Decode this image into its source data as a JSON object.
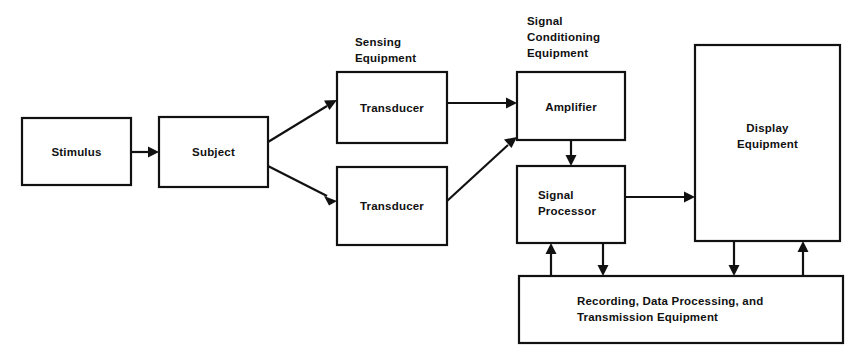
{
  "diagram": {
    "type": "block-diagram",
    "canvas": {
      "width": 868,
      "height": 362
    },
    "colors": {
      "background": "#ffffff",
      "stroke": "#111111",
      "box_fill": "#ffffff",
      "text": "#111111"
    },
    "group_labels": [
      {
        "id": "sensing-equipment",
        "lines": [
          "Sensing",
          "Equipment"
        ],
        "line1": "Sensing",
        "line2": "Equipment",
        "x": 355,
        "y": 42
      },
      {
        "id": "signal-conditioning-equipment",
        "lines": [
          "Signal",
          "Conditioning",
          "Equipment"
        ],
        "line1": "Signal",
        "line2": "Conditioning",
        "line3": "Equipment",
        "x": 527,
        "y": 25
      }
    ],
    "boxes": [
      {
        "id": "stimulus",
        "lines": [
          "Stimulus"
        ],
        "line1": "Stimulus",
        "x": 22,
        "y": 118,
        "w": 109,
        "h": 67,
        "text_align": "center"
      },
      {
        "id": "subject",
        "lines": [
          "Subject"
        ],
        "line1": "Subject",
        "x": 159,
        "y": 117,
        "w": 109,
        "h": 70,
        "text_align": "center"
      },
      {
        "id": "transducer-upper",
        "lines": [
          "Transducer"
        ],
        "line1": "Transducer",
        "x": 337,
        "y": 72,
        "w": 110,
        "h": 71,
        "text_align": "center"
      },
      {
        "id": "transducer-lower",
        "lines": [
          "Transducer"
        ],
        "line1": "Transducer",
        "x": 337,
        "y": 167,
        "w": 110,
        "h": 78,
        "text_align": "center"
      },
      {
        "id": "amplifier",
        "lines": [
          "Amplifier"
        ],
        "line1": "Amplifier",
        "x": 517,
        "y": 72,
        "w": 108,
        "h": 68,
        "text_align": "center"
      },
      {
        "id": "signal-processor",
        "lines": [
          "Signal",
          "Processor"
        ],
        "line1": "Signal",
        "line2": "Processor",
        "x": 517,
        "y": 166,
        "w": 108,
        "h": 77,
        "text_align": "left"
      },
      {
        "id": "display-equipment",
        "lines": [
          "Display",
          "Equipment"
        ],
        "line1": "Display",
        "line2": "Equipment",
        "x": 695,
        "y": 45,
        "w": 145,
        "h": 196,
        "text_align": "center"
      },
      {
        "id": "recording-data-processing",
        "lines": [
          "Recording, Data Processing, and",
          "Transmission Equipment"
        ],
        "line1": "Recording, Data Processing, and",
        "line2": "Transmission Equipment",
        "x": 519,
        "y": 276,
        "w": 324,
        "h": 67,
        "text_align": "left"
      }
    ],
    "connections": [
      {
        "id": "stimulus-to-subject",
        "from": "stimulus",
        "to": "subject",
        "kind": "straight-right"
      },
      {
        "id": "subject-to-transducer-upper",
        "from": "subject",
        "to": "transducer-upper",
        "kind": "diagonal-up-right"
      },
      {
        "id": "subject-to-transducer-lower",
        "from": "subject",
        "to": "transducer-lower",
        "kind": "diagonal-down-right"
      },
      {
        "id": "transducer-upper-to-amplifier",
        "from": "transducer-upper",
        "to": "amplifier",
        "kind": "straight-right"
      },
      {
        "id": "transducer-lower-to-amplifier",
        "from": "transducer-lower",
        "to": "amplifier",
        "kind": "diagonal-up-right"
      },
      {
        "id": "amplifier-to-signal-processor",
        "from": "amplifier",
        "to": "signal-processor",
        "kind": "straight-down"
      },
      {
        "id": "signal-processor-to-display",
        "from": "signal-processor",
        "to": "display-equipment",
        "kind": "straight-right"
      },
      {
        "id": "recording-to-signal-processor",
        "from": "recording-data-processing",
        "to": "signal-processor",
        "kind": "straight-up"
      },
      {
        "id": "signal-processor-to-recording",
        "from": "signal-processor",
        "to": "recording-data-processing",
        "kind": "straight-down"
      },
      {
        "id": "display-to-recording",
        "from": "display-equipment",
        "to": "recording-data-processing",
        "kind": "straight-down"
      },
      {
        "id": "recording-to-display",
        "from": "recording-data-processing",
        "to": "display-equipment",
        "kind": "straight-up"
      }
    ]
  }
}
